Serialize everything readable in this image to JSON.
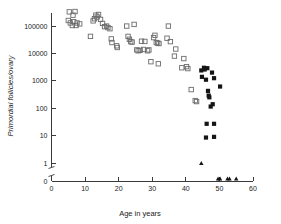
{
  "chart_data": {
    "type": "scatter",
    "title": "",
    "xlabel": "Age in years",
    "ylabel": "Primordial follicles/ovary",
    "xlim": [
      0,
      60
    ],
    "ylim_log": [
      1,
      300000
    ],
    "yscale": "log-with-zero-break",
    "grid": false,
    "legend_position": "none",
    "xticks": [
      0,
      10,
      20,
      30,
      40,
      50,
      60
    ],
    "xtick_labels": [
      "0",
      "10",
      "20",
      "30",
      "40",
      "50",
      "60"
    ],
    "yticks": [
      100000,
      10000,
      1000,
      100,
      10,
      1,
      0
    ],
    "ytick_labels": [
      "100000",
      "10000",
      "1000",
      "100",
      "10",
      "1",
      "0"
    ],
    "axis_break": {
      "between": [
        1,
        0
      ],
      "label": "y-axis break"
    },
    "series": [
      {
        "name": "premenopausal",
        "marker": "open-square",
        "color": "#6b6b6b",
        "points": [
          [
            5.0,
            160000
          ],
          [
            5.3,
            330000
          ],
          [
            5.6,
            130000
          ],
          [
            6.2,
            105000
          ],
          [
            6.4,
            250000
          ],
          [
            6.6,
            145000
          ],
          [
            7.0,
            340000
          ],
          [
            7.3,
            105000
          ],
          [
            7.6,
            130000
          ],
          [
            8.4,
            120000
          ],
          [
            11.6,
            42000
          ],
          [
            12.4,
            155000
          ],
          [
            12.8,
            185000
          ],
          [
            13.2,
            250000
          ],
          [
            13.6,
            215000
          ],
          [
            14.0,
            265000
          ],
          [
            14.6,
            175000
          ],
          [
            15.2,
            125000
          ],
          [
            15.8,
            95000
          ],
          [
            16.4,
            100000
          ],
          [
            16.8,
            88000
          ],
          [
            17.4,
            80000
          ],
          [
            17.8,
            34000
          ],
          [
            18.0,
            25000
          ],
          [
            19.4,
            19000
          ],
          [
            19.6,
            16500
          ],
          [
            22.4,
            100000
          ],
          [
            22.8,
            42000
          ],
          [
            23.2,
            33000
          ],
          [
            23.6,
            27000
          ],
          [
            24.0,
            26000
          ],
          [
            24.6,
            115000
          ],
          [
            25.4,
            13500
          ],
          [
            25.8,
            12500
          ],
          [
            26.4,
            13000
          ],
          [
            26.8,
            28000
          ],
          [
            27.4,
            14000
          ],
          [
            27.8,
            27500
          ],
          [
            28.6,
            12500
          ],
          [
            29.0,
            13500
          ],
          [
            29.6,
            5000
          ],
          [
            30.4,
            38000
          ],
          [
            30.8,
            46000
          ],
          [
            31.2,
            25000
          ],
          [
            31.6,
            24000
          ],
          [
            31.8,
            4200
          ],
          [
            32.0,
            23000
          ],
          [
            34.4,
            36000
          ],
          [
            34.8,
            100000
          ],
          [
            35.4,
            27000
          ],
          [
            36.6,
            8000
          ],
          [
            37.0,
            14500
          ],
          [
            38.8,
            3000
          ],
          [
            39.4,
            6500
          ],
          [
            40.2,
            3300
          ],
          [
            40.6,
            2800
          ],
          [
            41.6,
            480
          ],
          [
            42.8,
            190
          ],
          [
            43.2,
            175
          ]
        ]
      },
      {
        "name": "perimenopausal",
        "marker": "filled-square",
        "color": "#151515",
        "points": [
          [
            44.6,
            2400
          ],
          [
            44.8,
            1400
          ],
          [
            45.4,
            3000
          ],
          [
            45.6,
            2600
          ],
          [
            46.0,
            1100
          ],
          [
            46.4,
            2900
          ],
          [
            46.6,
            430
          ],
          [
            46.8,
            290
          ],
          [
            47.0,
            250
          ],
          [
            47.4,
            115
          ],
          [
            48.0,
            140
          ],
          [
            48.4,
            1250
          ],
          [
            50.2,
            620
          ],
          [
            46.2,
            27
          ],
          [
            48.4,
            27
          ],
          [
            46.0,
            8.5
          ],
          [
            48.4,
            9.0
          ],
          [
            47.8,
            2000
          ]
        ]
      },
      {
        "name": "postmenopausal",
        "marker": "filled-triangle",
        "color": "#151515",
        "points": [
          [
            44.6,
            1.0
          ],
          [
            49.6,
            0
          ],
          [
            50.2,
            0
          ],
          [
            52.4,
            0
          ],
          [
            53.0,
            0
          ],
          [
            55.0,
            0
          ]
        ]
      }
    ]
  },
  "axis_titles": {
    "x": "Age in years",
    "y": "Primordial follicles/ovary"
  }
}
